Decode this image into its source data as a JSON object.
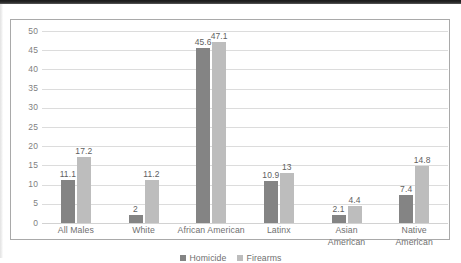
{
  "chart_data": {
    "type": "bar",
    "title": "",
    "subtitle": "",
    "xlabel": "",
    "ylabel": "",
    "categories": [
      "All Males",
      "White",
      "African American",
      "Latinx",
      "Asian American",
      "Native American"
    ],
    "category_lines": [
      [
        "All Males"
      ],
      [
        "White"
      ],
      [
        "African American"
      ],
      [
        "Latinx"
      ],
      [
        "Asian",
        "American"
      ],
      [
        "Native",
        "American"
      ]
    ],
    "series": [
      {
        "name": "Homicide",
        "color": "#848484",
        "values": [
          11.1,
          2,
          45.6,
          10.9,
          2.1,
          7.4
        ],
        "labels": [
          "11.1",
          "2",
          "45.6",
          "10.9",
          "2.1",
          "7.4"
        ]
      },
      {
        "name": "Firearms",
        "color": "#bdbdbd",
        "values": [
          17.2,
          11.2,
          47.1,
          13,
          4.4,
          14.8
        ],
        "labels": [
          "17.2",
          "11.2",
          "47.1",
          "13",
          "4.4",
          "14.8"
        ]
      }
    ],
    "ylim": [
      0,
      50
    ],
    "yticks": [
      50,
      45,
      40,
      35,
      30,
      25,
      20,
      15,
      10,
      5,
      0
    ],
    "ytick_labels": [
      "50",
      "45",
      "40",
      "35",
      "30",
      "25",
      "20",
      "15",
      "10",
      "5",
      "0"
    ],
    "grid": true,
    "grid_axis": "y",
    "legend_position": "bottom",
    "legend": [
      {
        "label": "Homicide",
        "color": "#848484"
      },
      {
        "label": "Firearms",
        "color": "#bdbdbd"
      }
    ]
  },
  "colors": {
    "homicide": "#848484",
    "firearms": "#bdbdbd",
    "gridline": "#dcdcdc",
    "frame_border": "#a9a9a9",
    "axis_text": "#7f7f7f",
    "label_text": "#5f5f5f"
  }
}
